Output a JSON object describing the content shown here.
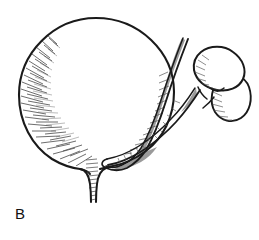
{
  "figure": {
    "panel_label": "B",
    "caption_text": "",
    "background_color": "#ffffff",
    "ink_color": "#1a1a1a",
    "shadow_gray": "#9a9a9a",
    "hatch_gray": "#555555",
    "width": 259,
    "height": 240
  },
  "anatomy": {
    "bladder": {
      "name": "bladder",
      "description": "large distended spherical urinary bladder",
      "center_x": 96,
      "center_y": 92,
      "radius_x": 78,
      "radius_y": 74,
      "shading": "hatched along left and lower-left margin"
    },
    "urethra": {
      "name": "urethra",
      "description": "narrow tube descending from bladder neck",
      "top_x": 92,
      "top_y": 160,
      "bottom_x": 93,
      "bottom_y": 202,
      "width": 8
    },
    "ureter_upper": {
      "name": "upper-pole-ureter",
      "description": "ureter draining upper renal moiety, runs along right bladder margin",
      "from": "kidney-upper-pole",
      "to": "bladder-wall"
    },
    "ureter_lower": {
      "name": "lower-pole-ureter",
      "description": "second ureter draining lower renal moiety",
      "from": "kidney-lower-pole",
      "to": "bladder-wall"
    },
    "kidney": {
      "name": "duplex-kidney",
      "description": "bean-shaped duplex kidney with upper and lower moiety",
      "center_x": 214,
      "center_y": 82,
      "lobes": 2,
      "shading": "hatched at hilum and lower pole"
    },
    "ureteric_insertion": {
      "name": "ureteric-insertion",
      "description": "point where ureters enter the posterior bladder wall",
      "x": 106,
      "y": 168
    }
  }
}
